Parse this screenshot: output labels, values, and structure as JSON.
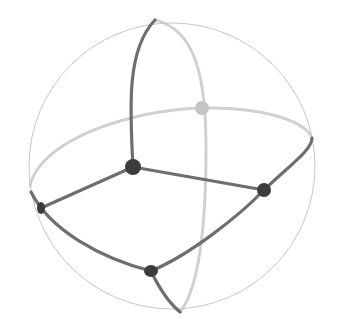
{
  "diagram": {
    "type": "sphere-with-great-circles",
    "canvas": {
      "width": 348,
      "height": 334,
      "background": "#ffffff"
    },
    "colors": {
      "outline": "#c8c8c8",
      "front_edge": "#6e6e6e",
      "back_edge": "#d0d0d0",
      "front_node": "#3c3c3c",
      "back_node": "#c4c4c4"
    },
    "sphere": {
      "cx": 172,
      "cy": 166,
      "r": 143
    },
    "nodes": [
      {
        "id": "center",
        "x": 133,
        "y": 167,
        "r": 8,
        "side": "front"
      },
      {
        "id": "back-top",
        "x": 202,
        "y": 108,
        "r": 7,
        "side": "back"
      },
      {
        "id": "right",
        "x": 264,
        "y": 190,
        "r": 7,
        "side": "front"
      },
      {
        "id": "left",
        "x": 41,
        "y": 208,
        "r": 6,
        "side": "front"
      },
      {
        "id": "bottom",
        "x": 151,
        "y": 271,
        "r": 7,
        "side": "front"
      }
    ],
    "edges": [
      {
        "id": "center-up",
        "side": "front",
        "d": "M133,167 C130,110 126,50 155,20"
      },
      {
        "id": "center-right",
        "side": "front",
        "d": "M133,167 L264,190"
      },
      {
        "id": "center-left",
        "side": "front",
        "d": "M133,167 L41,208"
      },
      {
        "id": "left-bottom",
        "side": "front",
        "d": "M31,192 C50,230 100,258 151,271"
      },
      {
        "id": "bottom-right",
        "side": "front",
        "d": "M151,271 C190,255 240,215 264,190 C290,165 312,150 312,138"
      },
      {
        "id": "bottom-down",
        "side": "front",
        "d": "M151,271 C160,290 168,302 180,312"
      },
      {
        "id": "back-meridian",
        "side": "back",
        "d": "M155,20 C195,30 206,75 206,150 C206,230 198,290 180,312"
      },
      {
        "id": "back-equator",
        "side": "back",
        "d": "M30,186 C40,140 130,110 202,108 C260,107 305,120 312,138"
      }
    ]
  }
}
